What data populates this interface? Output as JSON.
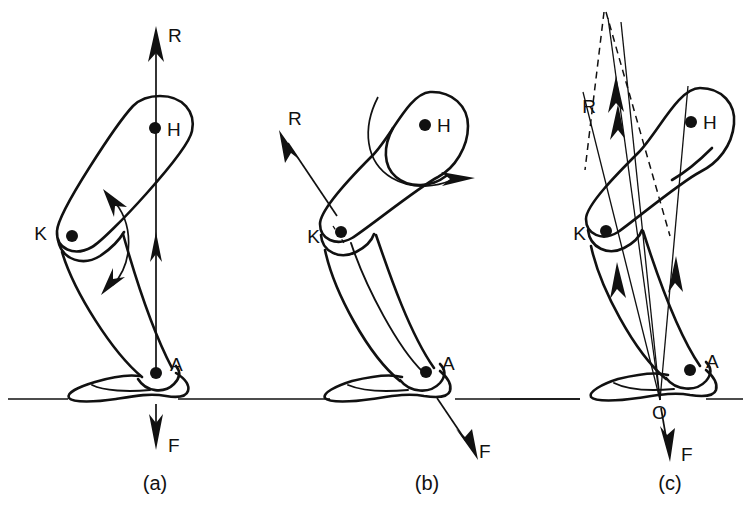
{
  "figure": {
    "line_color": "#111111",
    "background_color": "#ffffff"
  },
  "panels": [
    {
      "id": "a",
      "caption": "(a)",
      "joints": [
        {
          "key": "H",
          "label": "H",
          "name": "hip-joint"
        },
        {
          "key": "K",
          "label": "K",
          "name": "knee-joint"
        },
        {
          "key": "A",
          "label": "A",
          "name": "ankle-joint"
        }
      ],
      "vectors": [
        {
          "key": "R",
          "label": "R",
          "name": "reaction-force-vector",
          "direction": "up",
          "style": "solid"
        },
        {
          "key": "F",
          "label": "F",
          "name": "ground-force-vector",
          "direction": "down",
          "style": "solid"
        }
      ],
      "annotations": [
        {
          "key": "knee-arc",
          "name": "knee-rotation-arc",
          "type": "double-headed-arc"
        }
      ]
    },
    {
      "id": "b",
      "caption": "(b)",
      "joints": [
        {
          "key": "H",
          "label": "H",
          "name": "hip-joint"
        },
        {
          "key": "K",
          "label": "K",
          "name": "knee-joint"
        },
        {
          "key": "A",
          "label": "A",
          "name": "ankle-joint"
        }
      ],
      "vectors": [
        {
          "key": "R",
          "label": "R",
          "name": "reaction-force-vector",
          "direction": "up-left",
          "style": "solid"
        },
        {
          "key": "F",
          "label": "F",
          "name": "ground-force-vector",
          "direction": "down-right",
          "style": "solid"
        }
      ],
      "annotations": [
        {
          "key": "thigh-arc",
          "name": "thigh-rotation-arc",
          "type": "single-headed-arc"
        }
      ]
    },
    {
      "id": "c",
      "caption": "(c)",
      "joints": [
        {
          "key": "H",
          "label": "H",
          "name": "hip-joint"
        },
        {
          "key": "K",
          "label": "K",
          "name": "knee-joint"
        },
        {
          "key": "A",
          "label": "A",
          "name": "ankle-joint"
        },
        {
          "key": "O",
          "label": "O",
          "name": "origin-point"
        }
      ],
      "vectors": [
        {
          "key": "R",
          "label": "R",
          "name": "reaction-force-vector",
          "direction": "up",
          "style": "solid"
        },
        {
          "key": "F",
          "label": "F",
          "name": "ground-force-vector",
          "direction": "down",
          "style": "solid"
        }
      ],
      "annotations": [
        {
          "key": "dashed-left",
          "name": "dashed-construction-line-left",
          "type": "dashed-line"
        },
        {
          "key": "dashed-right",
          "name": "dashed-construction-line-right",
          "type": "dashed-line"
        }
      ]
    }
  ],
  "labels": {
    "hip": "H",
    "knee": "K",
    "ankle": "A",
    "origin": "O",
    "reaction": "R",
    "force": "F",
    "panel_a": "(a)",
    "panel_b": "(b)",
    "panel_c": "(c)"
  }
}
